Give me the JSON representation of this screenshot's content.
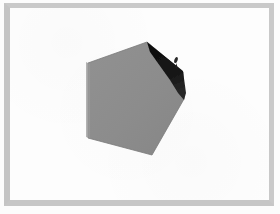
{
  "image": {
    "width": 280,
    "height": 214,
    "background_color": "#ffffff",
    "description": "Scanned page with a gray faceted polyhedron-like shape"
  },
  "frame": {
    "name": "page-border",
    "border_color": "#c7c7c7",
    "paper_color": "#fdfdfd",
    "outer_color": "#fcfcfc",
    "border_width_px": 5
  },
  "figure": {
    "title": "",
    "caption": "",
    "object_name": "gray-faceted-shape",
    "fill_color": "#8d8d8d",
    "edge_color": "#7a7a7a",
    "shadow_color": "#121212",
    "highlight_color": "#9a9a9a",
    "polygon_points": "88,63 147,42 183,72 184,99 152,155 88,138",
    "shadow_points": "147,42 183,71 186,93 184,100 178,93 170,80 160,66 150,52",
    "speck": {
      "x": 176,
      "y": 60,
      "w": 4,
      "h": 7,
      "color": "#2a2a2a"
    },
    "left_edge_highlight": "86,62 90,64 90,138 86,137"
  },
  "labels": {
    "none_visible": ""
  }
}
